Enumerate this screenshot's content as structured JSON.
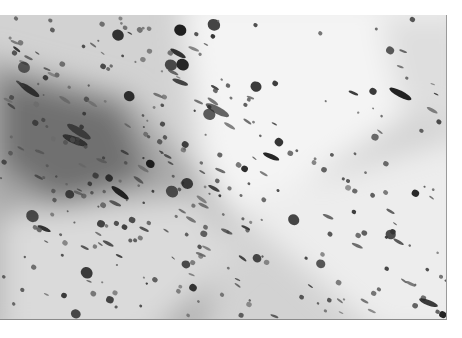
{
  "image": {
    "description": "Grayscale micrograph of tissue with densely scattered dark round and elongated nuclei over a lighter diagonal band",
    "palette": {
      "background": "#ffffff",
      "tissue_light": "#f2f2f2",
      "tissue_mid": "#c8c8c8",
      "tissue_dark": "#6e6e6e",
      "nucleus": "#1e1e1e"
    },
    "frame": {
      "x": 0,
      "y": 15,
      "width": 446,
      "height": 304
    }
  }
}
